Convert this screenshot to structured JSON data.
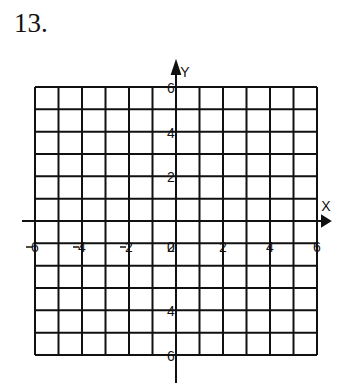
{
  "problem_number": "13.",
  "graph": {
    "x_axis_label": "X",
    "y_axis_label": "Y",
    "x_ticks": [
      "-6",
      "-4",
      "-2",
      "0",
      "2",
      "4",
      "6"
    ],
    "y_ticks_positive": [
      "6",
      "4",
      "2"
    ],
    "y_ticks_negative": [
      "2",
      "4",
      "6"
    ],
    "x_range": [
      -6,
      6
    ],
    "y_range": [
      -6,
      6
    ],
    "grid_columns": 12,
    "grid_rows": 12
  }
}
